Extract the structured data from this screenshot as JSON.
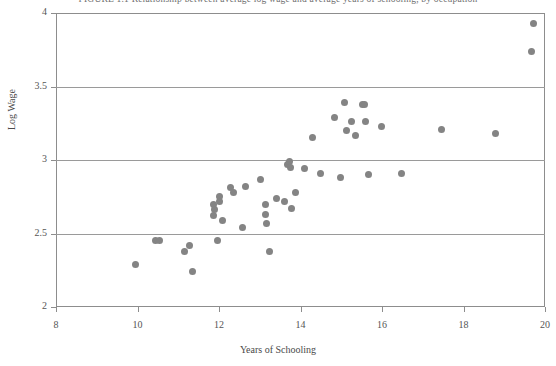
{
  "figure": {
    "caption": "FIGURE 1.1   Relationship between average log wage and average years of schooling, by occupation",
    "background": "#ffffff",
    "point_color": "#848484",
    "axis_color": "#8d8d8d"
  },
  "chart_data": {
    "type": "scatter",
    "title": "",
    "xlabel": "Years of Schooling",
    "ylabel": "Log Wage",
    "xlim": [
      8,
      20
    ],
    "ylim": [
      2,
      4
    ],
    "xticks": [
      8,
      10,
      12,
      14,
      16,
      18,
      20
    ],
    "yticks": [
      2,
      2.5,
      3,
      3.5,
      4
    ],
    "xtick_labels": [
      "8",
      "10",
      "12",
      "14",
      "16",
      "18",
      "20"
    ],
    "ytick_labels": [
      "2",
      "2.5",
      "3",
      "3.5",
      "4"
    ],
    "grid": "horizontal",
    "gridlines_y": [
      2.5,
      3,
      3.5
    ],
    "legend": null,
    "series": [
      {
        "name": "occupations",
        "marker": "filled-circle",
        "color": "#848484",
        "points": [
          [
            9.94,
            2.29
          ],
          [
            10.43,
            2.45
          ],
          [
            10.53,
            2.45
          ],
          [
            11.16,
            2.38
          ],
          [
            11.28,
            2.42
          ],
          [
            11.35,
            2.24
          ],
          [
            11.96,
            2.45
          ],
          [
            11.86,
            2.62
          ],
          [
            11.87,
            2.7
          ],
          [
            11.89,
            2.66
          ],
          [
            12.0,
            2.75
          ],
          [
            12.02,
            2.72
          ],
          [
            12.08,
            2.59
          ],
          [
            12.28,
            2.81
          ],
          [
            12.36,
            2.78
          ],
          [
            12.64,
            2.82
          ],
          [
            12.57,
            2.54
          ],
          [
            13.03,
            2.87
          ],
          [
            13.13,
            2.63
          ],
          [
            13.15,
            2.7
          ],
          [
            13.17,
            2.57
          ],
          [
            13.24,
            2.38
          ],
          [
            13.42,
            2.74
          ],
          [
            13.6,
            2.72
          ],
          [
            13.68,
            2.97
          ],
          [
            13.73,
            2.99
          ],
          [
            13.76,
            2.95
          ],
          [
            13.78,
            2.67
          ],
          [
            13.88,
            2.78
          ],
          [
            14.11,
            2.94
          ],
          [
            14.29,
            3.15
          ],
          [
            14.5,
            2.91
          ],
          [
            14.83,
            3.29
          ],
          [
            14.97,
            2.88
          ],
          [
            15.09,
            3.39
          ],
          [
            15.12,
            3.2
          ],
          [
            15.26,
            3.26
          ],
          [
            15.35,
            3.17
          ],
          [
            15.52,
            3.38
          ],
          [
            15.58,
            3.38
          ],
          [
            15.6,
            3.26
          ],
          [
            15.66,
            2.9
          ],
          [
            15.99,
            3.23
          ],
          [
            16.47,
            2.91
          ],
          [
            17.46,
            3.21
          ],
          [
            18.79,
            3.18
          ],
          [
            19.73,
            3.93
          ],
          [
            19.68,
            3.74
          ]
        ]
      }
    ]
  }
}
